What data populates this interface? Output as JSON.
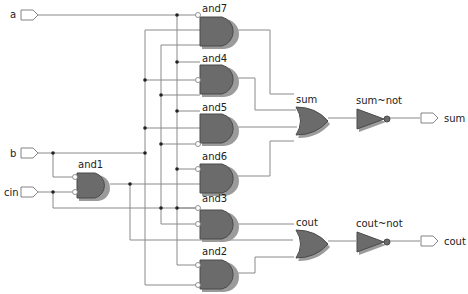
{
  "diagram": {
    "type": "gate-level netlist (full adder)",
    "inputs": [
      {
        "name": "a",
        "label": "a"
      },
      {
        "name": "b",
        "label": "b"
      },
      {
        "name": "cin",
        "label": "cin"
      }
    ],
    "outputs": [
      {
        "name": "sum",
        "label": "sum"
      },
      {
        "name": "cout",
        "label": "cout"
      }
    ],
    "gates": {
      "and1": "and1",
      "and2": "and2",
      "and3": "and3",
      "and4": "and4",
      "and5": "and5",
      "and6": "and6",
      "and7": "and7",
      "or_sum": "sum",
      "or_cout": "cout",
      "not_sum": "sum~not",
      "not_cout": "cout~not"
    },
    "colors": {
      "gate_fill": "#6b6b6b",
      "wire": "#8a8a8a",
      "background": "#ffffff"
    }
  }
}
